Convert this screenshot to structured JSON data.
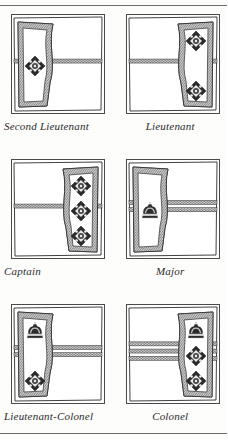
{
  "page": {
    "background_color": "#fdfdfc",
    "ink_color": "#2b2b2b",
    "rule_color": "#6b6b6b",
    "top_rule": true,
    "bottom_rule": true
  },
  "plate": {
    "type": "rank-insignia-plate",
    "columns": 2,
    "rows": 3,
    "items": [
      {
        "caption": "Second Lieutenant",
        "panel_side": "left",
        "crowns": 0,
        "pips": 1,
        "lace_bands": 1,
        "pip_name": "bath-star-pip",
        "crown_name": "kings-crown"
      },
      {
        "caption": "Lieutenant",
        "panel_side": "right",
        "crowns": 0,
        "pips": 2,
        "lace_bands": 1,
        "pip_name": "bath-star-pip",
        "crown_name": "kings-crown"
      },
      {
        "caption": "Captain",
        "panel_side": "right",
        "crowns": 0,
        "pips": 3,
        "lace_bands": 1,
        "pip_name": "bath-star-pip",
        "crown_name": "kings-crown"
      },
      {
        "caption": "Major",
        "panel_side": "left",
        "crowns": 1,
        "pips": 0,
        "lace_bands": 2,
        "pip_name": "bath-star-pip",
        "crown_name": "kings-crown"
      },
      {
        "caption": "Lieutenant-Colonel",
        "panel_side": "left",
        "crowns": 1,
        "pips": 1,
        "lace_bands": 2,
        "pip_name": "bath-star-pip",
        "crown_name": "kings-crown"
      },
      {
        "caption": "Colonel",
        "panel_side": "right",
        "crowns": 1,
        "pips": 2,
        "lace_bands": 3,
        "pip_name": "bath-star-pip",
        "crown_name": "kings-crown"
      }
    ]
  }
}
